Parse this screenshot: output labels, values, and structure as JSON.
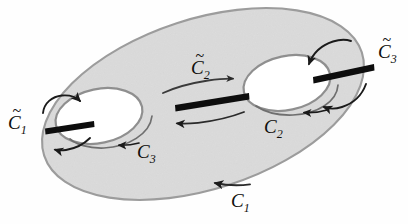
{
  "figure": {
    "colors": {
      "surface_fill": "#e0e0e0",
      "surface_stroke": "#9a9a9a",
      "hole_fill": "#ffffff",
      "hole_stroke": "#8d8d8d",
      "bar_color": "#0d0d0d",
      "arrow_color": "#1a1a1a",
      "label_color": "#100f0d",
      "background": "#fefefe"
    }
  },
  "labels": {
    "c1_tilde": {
      "base": "C",
      "sub": "1",
      "accent": "~",
      "name": "C-tilde-1"
    },
    "c2_tilde": {
      "base": "C",
      "sub": "2",
      "accent": "~",
      "name": "C-tilde-2"
    },
    "c3_tilde": {
      "base": "C",
      "sub": "3",
      "accent": "~",
      "name": "C-tilde-3"
    },
    "c1": {
      "base": "C",
      "sub": "1",
      "accent": "",
      "name": "C-1"
    },
    "c2": {
      "base": "C",
      "sub": "2",
      "accent": "",
      "name": "C-2"
    },
    "c3": {
      "base": "C",
      "sub": "3",
      "accent": "",
      "name": "C-3"
    }
  },
  "curves": {
    "transverse_bars": [
      {
        "id": "c1-tilde-bar",
        "label": "C̃₁",
        "x1": 46,
        "y1": 127,
        "x2": 93,
        "y2": 120
      },
      {
        "id": "c2-tilde-bar",
        "label": "C̃₂",
        "x1": 176,
        "y1": 104,
        "x2": 248,
        "y2": 93
      },
      {
        "id": "c3-tilde-bar",
        "label": "C̃₃",
        "x1": 314,
        "y1": 76,
        "x2": 373,
        "y2": 64
      }
    ],
    "oriented_loops": [
      {
        "id": "c1-loop",
        "label": "C₁",
        "position": "outer-bottom-boundary",
        "direction": "right"
      },
      {
        "id": "c2-loop",
        "label": "C₂",
        "position": "around-right-hole",
        "direction": "left"
      },
      {
        "id": "c3-loop",
        "label": "C₃",
        "position": "around-left-hole",
        "direction": "left"
      }
    ]
  }
}
